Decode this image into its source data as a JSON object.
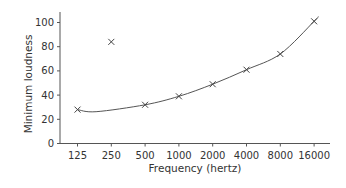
{
  "chart_data": {
    "type": "line",
    "title": "",
    "xlabel": "Frequency (hertz)",
    "ylabel": "Minimum loudness",
    "x_scale": "log2",
    "categories": [
      "125",
      "250",
      "500",
      "1000",
      "2000",
      "4000",
      "8000",
      "16000"
    ],
    "series": [
      {
        "name": "Measured points",
        "marker": "x",
        "values": [
          28,
          84,
          32,
          39,
          49,
          61,
          74,
          101
        ]
      }
    ],
    "fit_curve": {
      "description": "Smooth curve through all points except the 250 Hz outlier",
      "passes_through": [
        "125",
        "500",
        "1000",
        "2000",
        "4000",
        "8000",
        "16000"
      ]
    },
    "yticks": [
      0,
      20,
      40,
      60,
      80,
      100
    ],
    "ylim": [
      0,
      110
    ],
    "grid": false,
    "legend": null,
    "colors": {
      "axis": "#555555",
      "line": "#555555",
      "marker": "#444444",
      "text": "#333333"
    }
  }
}
